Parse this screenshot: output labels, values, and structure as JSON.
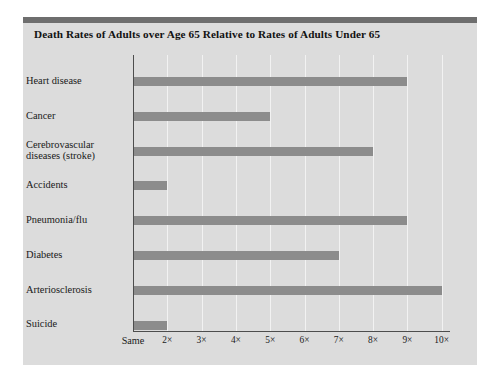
{
  "panel": {
    "title": "Death Rates of Adults over Age 65 Relative to Rates of Adults Under 65",
    "background_color": "#dcdcdc",
    "topbar_color": "#6e6e6e",
    "bar_color": "#8c8c8c",
    "axis_color": "#4d4d4d",
    "gridline_color": "#f2f2f2"
  },
  "chart_data": {
    "type": "bar",
    "orientation": "horizontal",
    "title": "Death Rates of Adults over Age 65 Relative to Rates of Adults Under 65",
    "xlabel": "",
    "ylabel": "",
    "categories": [
      "Heart disease",
      "Cancer",
      "Cerebrovascular diseases (stroke)",
      "Accidents",
      "Pneumonia/flu",
      "Diabetes",
      "Arteriosclerosis",
      "Suicide"
    ],
    "category_lines": [
      [
        "Heart disease"
      ],
      [
        "Cancer"
      ],
      [
        "Cerebrovascular",
        "diseases (stroke)"
      ],
      [
        "Accidents"
      ],
      [
        "Pneumonia/flu"
      ],
      [
        "Diabetes"
      ],
      [
        "Arteriosclerosis"
      ],
      [
        "Suicide"
      ]
    ],
    "values": [
      9,
      5,
      8,
      2,
      9,
      7,
      10,
      2
    ],
    "xlim": [
      1,
      10.2
    ],
    "xticks": [
      1,
      2,
      3,
      4,
      5,
      6,
      7,
      8,
      9,
      10
    ],
    "xticklabels": [
      "Same",
      "2×",
      "3×",
      "4×",
      "5×",
      "6×",
      "7×",
      "8×",
      "9×",
      "10×"
    ],
    "grid": true,
    "legend": null
  }
}
